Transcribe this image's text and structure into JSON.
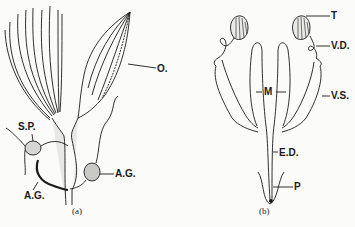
{
  "figure": {
    "panel_a": {
      "caption": "(a)",
      "labels": {
        "ovary": "O.",
        "spermatheca": "S.P.",
        "accessory_gland_right": "A.G.",
        "accessory_gland_left": "A.G."
      }
    },
    "panel_b": {
      "caption": "(b)",
      "labels": {
        "testis": "T",
        "vas_deferens": "V.D.",
        "mushroom_gland": "M",
        "vesicula_seminalis": "V.S.",
        "ejaculatory_duct": "E.D.",
        "penis": "P"
      }
    },
    "colors": {
      "ink": "#1a1a1a",
      "background": "#fbfbf9"
    }
  }
}
